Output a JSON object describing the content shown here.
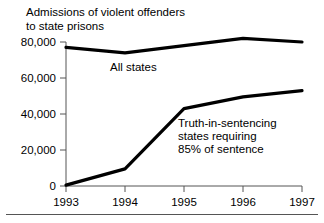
{
  "chart_data": {
    "type": "line",
    "title": "Admissions of violent offenders\nto state prisons",
    "xlabel": "",
    "ylabel": "",
    "x": [
      1993,
      1994,
      1995,
      1996,
      1997
    ],
    "categories": [
      "1993",
      "1994",
      "1995",
      "1996",
      "1997"
    ],
    "xtick_labels": [
      "1993",
      "1994",
      "1995",
      "1996",
      "1997"
    ],
    "ytick_labels": [
      "0",
      "20,000",
      "40,000",
      "60,000",
      "80,000"
    ],
    "ytick_values": [
      0,
      20000,
      40000,
      60000,
      80000
    ],
    "ylim": [
      0,
      85000
    ],
    "xlim": [
      1993,
      1997
    ],
    "grid": false,
    "legend": "annotations",
    "series": [
      {
        "name": "All states",
        "label": "All states",
        "color": "#000000",
        "values": [
          77000,
          74000,
          78000,
          82000,
          80000
        ]
      },
      {
        "name": "Truth-in-sentencing states requiring 85% of sentence",
        "label": "Truth-in-sentencing\nstates requiring\n85% of sentence",
        "color": "#000000",
        "values": [
          500,
          9500,
          43000,
          49500,
          53000
        ]
      }
    ],
    "annotations": [
      {
        "text": "All states",
        "x": 1994.0,
        "y": 68000
      },
      {
        "text": "Truth-in-sentencing\nstates requiring\n85% of sentence",
        "x": 1995.0,
        "y": 37000
      }
    ]
  }
}
